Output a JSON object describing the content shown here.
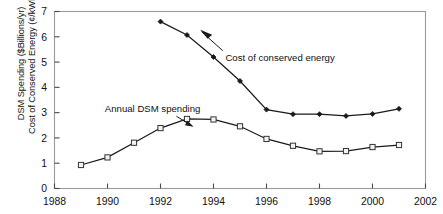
{
  "chart_data": {
    "type": "line",
    "title": "",
    "xlabel": "",
    "ylabel": "DSM Spending ($Billions/yr) Cost of Conserved Energy (¢/kWh)",
    "ylabel_lines": [
      "DSM Spending ($Billions/yr)",
      "Cost of Conserved Energy (¢/kWh)"
    ],
    "xlim": [
      1988,
      2002
    ],
    "ylim": [
      0,
      7
    ],
    "xticks": [
      1988,
      1990,
      1992,
      1994,
      1996,
      1998,
      2000,
      2002
    ],
    "xtick_labels": [
      "1988",
      "1990",
      "1992",
      "1994",
      "1996",
      "1998",
      "2000",
      "2002"
    ],
    "yticks": [
      0,
      1,
      2,
      3,
      4,
      5,
      6,
      7
    ],
    "ytick_labels": [
      "0",
      "1",
      "2",
      "3",
      "4",
      "5",
      "6",
      "7"
    ],
    "grid": false,
    "legend_position": "inline-annotation",
    "series": [
      {
        "name": "Cost of conserved energy",
        "marker": "filled-diamond",
        "color": "#1a1a1a",
        "x": [
          1992,
          1993,
          1994,
          1995,
          1996,
          1997,
          1998,
          1999,
          2000,
          2001
        ],
        "values": [
          6.6,
          6.07,
          5.2,
          4.25,
          3.12,
          2.94,
          2.94,
          2.87,
          2.95,
          3.15
        ]
      },
      {
        "name": "Annual DSM spending",
        "marker": "open-square",
        "color": "#1a1a1a",
        "x": [
          1989,
          1990,
          1991,
          1992,
          1993,
          1994,
          1995,
          1996,
          1997,
          1998,
          1999,
          2000,
          2001
        ],
        "values": [
          0.93,
          1.23,
          1.81,
          2.39,
          2.75,
          2.73,
          2.46,
          1.96,
          1.69,
          1.47,
          1.48,
          1.64,
          1.72
        ]
      }
    ],
    "annotations": [
      {
        "text": "Cost of conserved energy",
        "for_series": "Cost of conserved energy",
        "x": 1994.45,
        "y": 5.05
      },
      {
        "text": "Annual DSM spending",
        "for_series": "Annual DSM spending",
        "x": 1989.9,
        "y": 3.03
      }
    ]
  }
}
